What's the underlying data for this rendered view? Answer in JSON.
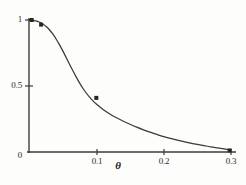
{
  "chart_data": {
    "type": "line",
    "title": "",
    "subtitle": "",
    "xlabel": "θ",
    "ylabel": "",
    "xlim": [
      0,
      0.3
    ],
    "ylim": [
      0,
      1
    ],
    "grid": false,
    "legend": null,
    "x_ticks": [
      {
        "value": 0,
        "label": ""
      },
      {
        "value": 0.1,
        "label": "0.1"
      },
      {
        "value": 0.2,
        "label": "0.2"
      },
      {
        "value": 0.3,
        "label": "0.3"
      }
    ],
    "y_ticks": [
      {
        "value": 0,
        "label": "0"
      },
      {
        "value": 0.5,
        "label": "0.5"
      },
      {
        "value": 1,
        "label": "1"
      }
    ],
    "series": [
      {
        "name": "curve",
        "type": "line",
        "color": "#3a3a3a",
        "x": [
          0.0,
          0.005,
          0.01,
          0.015,
          0.02,
          0.025,
          0.03,
          0.035,
          0.04,
          0.045,
          0.05,
          0.055,
          0.06,
          0.065,
          0.07,
          0.075,
          0.08,
          0.085,
          0.09,
          0.095,
          0.1,
          0.11,
          0.12,
          0.13,
          0.14,
          0.15,
          0.16,
          0.17,
          0.18,
          0.19,
          0.2,
          0.21,
          0.22,
          0.23,
          0.24,
          0.25,
          0.26,
          0.27,
          0.28,
          0.29,
          0.3
        ],
        "y": [
          1.0,
          0.998,
          0.993,
          0.985,
          0.972,
          0.953,
          0.928,
          0.896,
          0.858,
          0.815,
          0.768,
          0.718,
          0.667,
          0.617,
          0.569,
          0.524,
          0.483,
          0.447,
          0.415,
          0.387,
          0.363,
          0.322,
          0.288,
          0.259,
          0.233,
          0.21,
          0.188,
          0.168,
          0.15,
          0.133,
          0.117,
          0.103,
          0.09,
          0.078,
          0.067,
          0.057,
          0.048,
          0.039,
          0.031,
          0.023,
          0.015
        ]
      },
      {
        "name": "data-points",
        "type": "scatter",
        "marker": "square",
        "color": "#262626",
        "x": [
          0.004,
          0.018,
          0.1,
          0.298
        ],
        "y": [
          1.0,
          0.965,
          0.41,
          0.012
        ]
      }
    ]
  },
  "axes": {
    "y_axis_name": "y-axis",
    "x_axis_name": "x-axis"
  }
}
